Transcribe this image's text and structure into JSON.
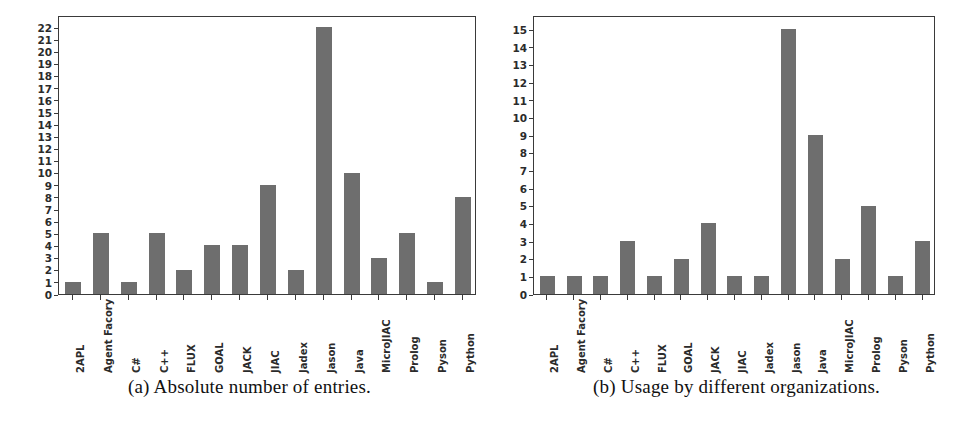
{
  "figure": {
    "panels": [
      {
        "id": "panel-a",
        "caption": "(a) Absolute number of entries."
      },
      {
        "id": "panel-b",
        "caption": "(b) Usage by different organizations."
      }
    ]
  },
  "chart_data": [
    {
      "type": "bar",
      "title": "(a) Absolute number of entries.",
      "xlabel": "",
      "ylabel": "",
      "ylim": [
        0,
        23
      ],
      "yticks": [
        0,
        1,
        2,
        3,
        4,
        5,
        6,
        7,
        8,
        9,
        10,
        11,
        12,
        13,
        14,
        15,
        16,
        17,
        18,
        19,
        20,
        21,
        22
      ],
      "grid": false,
      "legend": "none",
      "bar_color": "#6e6e6e",
      "axis_color": "#3a3a3a",
      "categories": [
        "2APL",
        "Agent Facory",
        "C#",
        "C++",
        "FLUX",
        "GOAL",
        "JACK",
        "JIAC",
        "Jadex",
        "Jason",
        "Java",
        "MicroJIAC",
        "Prolog",
        "Pyson",
        "Python"
      ],
      "values": [
        1,
        5,
        1,
        5,
        2,
        4,
        4,
        9,
        2,
        22,
        10,
        3,
        5,
        1,
        8
      ]
    },
    {
      "type": "bar",
      "title": "(b) Usage by different organizations.",
      "xlabel": "",
      "ylabel": "",
      "ylim": [
        0,
        15.8
      ],
      "yticks": [
        0,
        1,
        2,
        3,
        4,
        5,
        6,
        7,
        8,
        9,
        10,
        11,
        12,
        13,
        14,
        15
      ],
      "grid": false,
      "legend": "none",
      "bar_color": "#6e6e6e",
      "axis_color": "#3a3a3a",
      "categories": [
        "2APL",
        "Agent Facory",
        "C#",
        "C++",
        "FLUX",
        "GOAL",
        "JACK",
        "JIAC",
        "Jadex",
        "Jason",
        "Java",
        "MicroJIAC",
        "Prolog",
        "Pyson",
        "Python"
      ],
      "values": [
        1,
        1,
        1,
        3,
        1,
        2,
        4,
        1,
        1,
        15,
        9,
        2,
        5,
        1,
        3
      ]
    }
  ]
}
